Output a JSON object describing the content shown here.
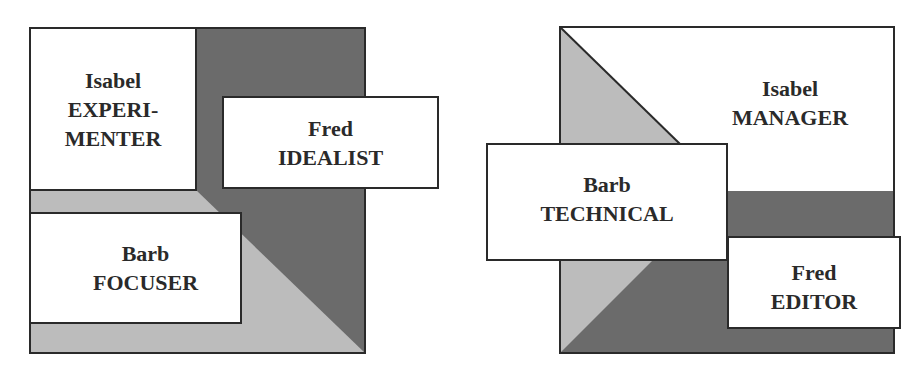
{
  "colors": {
    "dark": "#6b6b6b",
    "light": "#bcbcbc",
    "white": "#ffffff",
    "border": "#2a2a2a"
  },
  "diagrams": [
    {
      "id": "left",
      "boxes": [
        {
          "name": "Isabel",
          "role_line1": "EXPERI-",
          "role_line2": "MENTER"
        },
        {
          "name": "Fred",
          "role": "IDEALIST"
        },
        {
          "name": "Barb",
          "role": "FOCUSER"
        }
      ]
    },
    {
      "id": "right",
      "boxes": [
        {
          "name": "Isabel",
          "role": "MANAGER"
        },
        {
          "name": "Barb",
          "role": "TECHNICAL"
        },
        {
          "name": "Fred",
          "role": "EDITOR"
        }
      ]
    }
  ]
}
